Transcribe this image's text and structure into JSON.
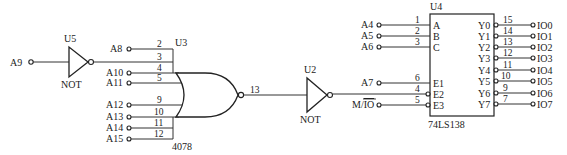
{
  "diagram": {
    "type": "logic-circuit",
    "u5": {
      "ref": "U5",
      "type": "NOT",
      "input": "A9"
    },
    "u3": {
      "ref": "U3",
      "part": "4078",
      "type": "NOR",
      "inputs": [
        {
          "pin": "2",
          "signal": "A8"
        },
        {
          "pin": "3",
          "signal": "U5 out"
        },
        {
          "pin": "4",
          "signal": "A10"
        },
        {
          "pin": "5",
          "signal": "A11"
        },
        {
          "pin": "9",
          "signal": "A12"
        },
        {
          "pin": "10",
          "signal": "A13"
        },
        {
          "pin": "11",
          "signal": "A14"
        },
        {
          "pin": "12",
          "signal": "A15"
        }
      ],
      "output_pin": "13"
    },
    "u2": {
      "ref": "U2",
      "type": "NOT"
    },
    "u4": {
      "ref": "U4",
      "part": "74LS138",
      "inputs": [
        {
          "pin": "1",
          "name": "A",
          "signal": "A4"
        },
        {
          "pin": "2",
          "name": "B",
          "signal": "A5"
        },
        {
          "pin": "3",
          "name": "C",
          "signal": "A6"
        },
        {
          "pin": "6",
          "name": "E1",
          "signal": "A7"
        },
        {
          "pin": "4",
          "name": "E2",
          "signal": "U2 out"
        },
        {
          "pin": "5",
          "name": "E3",
          "signal": "M/IO"
        }
      ],
      "outputs": [
        {
          "pin": "15",
          "name": "Y0",
          "signal": "IO0"
        },
        {
          "pin": "14",
          "name": "Y1",
          "signal": "IO1"
        },
        {
          "pin": "13",
          "name": "Y2",
          "signal": "IO2"
        },
        {
          "pin": "12",
          "name": "Y3",
          "signal": "IO3"
        },
        {
          "pin": "11",
          "name": "Y4",
          "signal": "IO4"
        },
        {
          "pin": "10",
          "name": "Y5",
          "signal": "IO5"
        },
        {
          "pin": "9",
          "name": "Y6",
          "signal": "IO6"
        },
        {
          "pin": "7",
          "name": "Y7",
          "signal": "IO7"
        }
      ]
    },
    "labels": {
      "a9": "A9",
      "u5_ref": "U5",
      "u5_type": "NOT",
      "a8": "A8",
      "a10": "A10",
      "a11": "A11",
      "a12": "A12",
      "a13": "A13",
      "a14": "A14",
      "a15": "A15",
      "u3_ref": "U3",
      "u3_part": "4078",
      "p2": "2",
      "p3": "3",
      "p4": "4",
      "p5": "5",
      "p9": "9",
      "p10": "10",
      "p11": "11",
      "p12": "12",
      "p13": "13",
      "u2_ref": "U2",
      "u2_type": "NOT",
      "a4": "A4",
      "a5": "A5",
      "a6": "A6",
      "a7": "A7",
      "mio_m": "M/",
      "mio_io": "IO",
      "u4_ref": "U4",
      "u4_part": "74LS138",
      "in_pins": [
        "1",
        "2",
        "3",
        "6",
        "4",
        "5"
      ],
      "in_names": [
        "A",
        "B",
        "C",
        "E1",
        "E2",
        "E3"
      ],
      "out_pins": [
        "15",
        "14",
        "13",
        "12",
        "11",
        "10",
        "9",
        "7"
      ],
      "out_names": [
        "Y0",
        "Y1",
        "Y2",
        "Y3",
        "Y4",
        "Y5",
        "Y6",
        "Y7"
      ],
      "out_signals": [
        "IO0",
        "IO1",
        "IO2",
        "IO3",
        "IO4",
        "IO5",
        "IO6",
        "IO7"
      ]
    }
  }
}
